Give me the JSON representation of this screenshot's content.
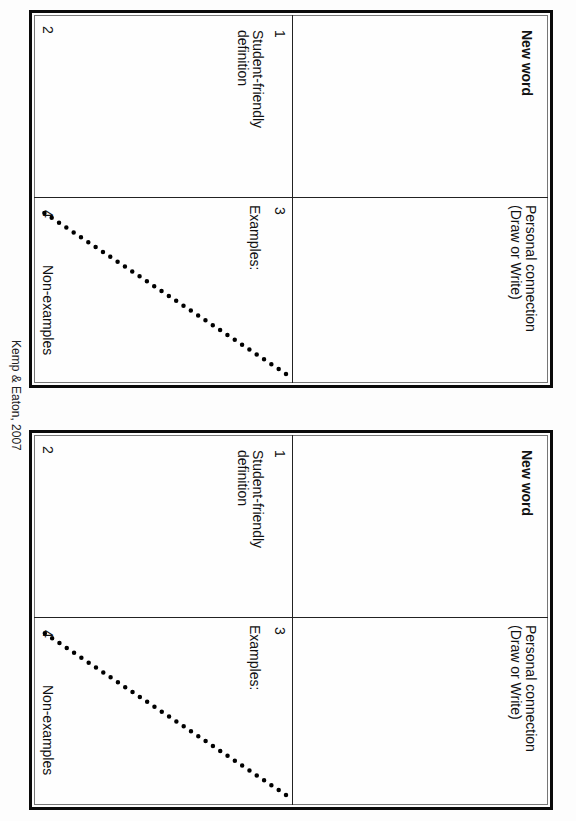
{
  "document": {
    "type": "Frayer-style vocabulary card worksheet (page rotated 90°)",
    "caption": "Kemp & Eaton, 2007"
  },
  "cards": [
    {
      "title": "New word",
      "quadrants": {
        "q1": {
          "number": "1",
          "label": ""
        },
        "q2": {
          "number": "2",
          "label_line1": "Student-friendly",
          "label_line2": "definition"
        },
        "q3": {
          "number": "3",
          "label": "Examples:"
        },
        "q4": {
          "number": "4",
          "label": "Non-examples"
        }
      },
      "personal_connection": {
        "line1": "Personal connection",
        "line2": "(Draw or Write)"
      }
    },
    {
      "title": "New word",
      "quadrants": {
        "q1": {
          "number": "1",
          "label": ""
        },
        "q2": {
          "number": "2",
          "label_line1": "Student-friendly",
          "label_line2": "definition"
        },
        "q3": {
          "number": "3",
          "label": "Examples:"
        },
        "q4": {
          "number": "4",
          "label": "Non-examples"
        }
      },
      "personal_connection": {
        "line1": "Personal connection",
        "line2": "(Draw or Write)"
      }
    }
  ],
  "colors": {
    "border": "#0a0a0a",
    "inner_line": "#777777",
    "divider": "#222222",
    "dots": "#000000"
  }
}
